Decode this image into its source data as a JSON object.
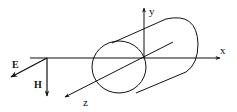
{
  "diagram": {
    "axes": {
      "x": {
        "label": "x"
      },
      "y": {
        "label": "y"
      },
      "z": {
        "label": "z"
      }
    },
    "fields": {
      "E": {
        "label": "E"
      },
      "H": {
        "label": "H"
      }
    },
    "colors": {
      "stroke": "#111111",
      "background": "#ffffff"
    }
  }
}
